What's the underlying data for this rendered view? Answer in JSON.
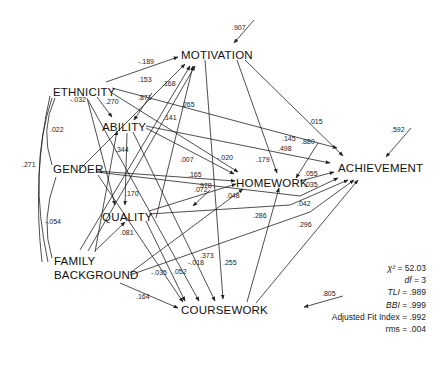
{
  "nodes": {
    "motivation": "MOTIVATION",
    "ethnicity": "ETHNICITY",
    "ability": "ABILITY",
    "gender": "GENDER",
    "homework": "HOMEWORK",
    "achievement": "ACHIEVEMENT",
    "quality": "QUALITY",
    "family_1": "FAMILY",
    "family_2": "BACKGROUND",
    "coursework": "COURSEWORK"
  },
  "disturbances": {
    "motivation": ".907",
    "achievement": ".592",
    "homework": ".880",
    "quality": ".978",
    "ability": ".871",
    "coursework": ".805"
  },
  "correlations": {
    "ethnicity_gender": ".022",
    "ethnicity_family": ".271",
    "gender_family": "-.054"
  },
  "paths": {
    "eth_mot": "-.189",
    "eth_abil": ".270",
    "eth_qual": "-.032",
    "fam_mot": ".153",
    "gen_mot": ".168",
    "abil_mot": ".265",
    "qual_mot": ".141",
    "fam_abil": ".344",
    "abil_qual": ".170",
    "fam_qual": ".081",
    "abil_hw": ".007",
    "mot_hw": ".179",
    "eth_hw": "-.020",
    "gen_hw": ".165",
    "qual_hw": ".072",
    "fam_hw": ".048",
    "mot_ach": ".015",
    "eth_ach": ".145",
    "abil_ach": ".498",
    "hw_ach": ".055",
    "gen_ach": ".035",
    "qual_ach": ".042",
    "cw_ach": ".296",
    "cw_hw": ".286",
    "fam_cw": ".164",
    "fam_cw2": "-.035",
    "qual_cw": ".052",
    "eth_cw": "-.018",
    "abil_cw": ".373",
    "mot_cw": ".255"
  },
  "fit_indices": [
    {
      "label": "χ²",
      "value": "52.03"
    },
    {
      "label": "df",
      "value": "3"
    },
    {
      "label": "TLI",
      "value": ".989"
    },
    {
      "label": "BBI",
      "value": ".999"
    },
    {
      "label": "Adjusted Fit Index",
      "value": ".992"
    },
    {
      "label": "rms",
      "value": ".004"
    }
  ]
}
